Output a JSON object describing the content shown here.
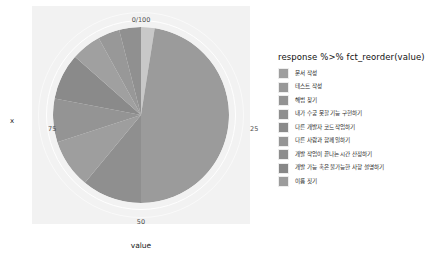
{
  "plot": {
    "axis_titles": {
      "x": "value",
      "y": "x"
    },
    "ticks": {
      "top": "0/100",
      "right": "25",
      "bottom": "50",
      "left": "75"
    },
    "panel_bg": "#f2f2f2",
    "grid_color": "#ffffff"
  },
  "legend": {
    "title": "response %>% fct_reorder(value)",
    "items": [
      {
        "label": "문서 작성",
        "color": "#9e9e9e"
      },
      {
        "label": "테스트 작성",
        "color": "#989898"
      },
      {
        "label": "해법 찾기",
        "color": "#939393"
      },
      {
        "label": "내가 수궁 못할 기능 구현하기",
        "color": "#8e8e8e"
      },
      {
        "label": "다른 개발자 코드 작업하기",
        "color": "#8a8a8a"
      },
      {
        "label": "다른 사람과 함께 일하기",
        "color": "#959595"
      },
      {
        "label": "개발 작업이 끝나는 시간 산정하기",
        "color": "#8d8d8d"
      },
      {
        "label": "개발 가능 혹은 불가능한 사항 설명하기",
        "color": "#878787"
      },
      {
        "label": "이름 짓기",
        "color": "#9c9c9c"
      }
    ]
  },
  "chart_data": {
    "type": "pie",
    "title": "",
    "xlabel": "value",
    "ylabel": "x",
    "tick_labels": [
      "0/100",
      "25",
      "50",
      "75"
    ],
    "axis_range": [
      0,
      100
    ],
    "grid": true,
    "legend_position": "right",
    "legend_title": "response %>% fct_reorder(value)",
    "categories": [
      "문서 작성",
      "테스트 작성",
      "해법 찾기",
      "내가 수긍 못할 기능 구현하기",
      "다른 개발자 코드 작업하기",
      "다른 사람과 함께 일하기",
      "개발 작업이 끝나는 시간 산정하기",
      "개발 가능 혹은 불가능한 사항 설명하기",
      "이름 짓기"
    ],
    "values": [
      2.5,
      47.5,
      11,
      9,
      8,
      8.5,
      5.5,
      4,
      4
    ],
    "slice_colors": [
      "#c8c8c8",
      "#9b9b9b",
      "#8f8f8f",
      "#9e9e9e",
      "#949494",
      "#8a8a8a",
      "#a0a0a0",
      "#989898",
      "#909090"
    ],
    "units": "percent"
  }
}
